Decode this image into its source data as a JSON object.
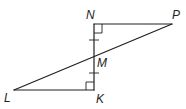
{
  "diagram": {
    "type": "geometry",
    "colors": {
      "stroke": "#231f20",
      "background": "#ffffff"
    },
    "points": {
      "N": {
        "label": "N",
        "x": 94,
        "y": 24
      },
      "P": {
        "label": "P",
        "x": 172,
        "y": 24
      },
      "M": {
        "label": "M",
        "x": 94,
        "y": 58
      },
      "K": {
        "label": "K",
        "x": 94,
        "y": 90
      },
      "L": {
        "label": "L",
        "x": 14,
        "y": 90
      }
    },
    "segments": [
      "NP",
      "NK",
      "LP",
      "LK"
    ],
    "right_angles": [
      "N",
      "K"
    ],
    "congruence_marks": [
      "NM",
      "MK"
    ]
  }
}
